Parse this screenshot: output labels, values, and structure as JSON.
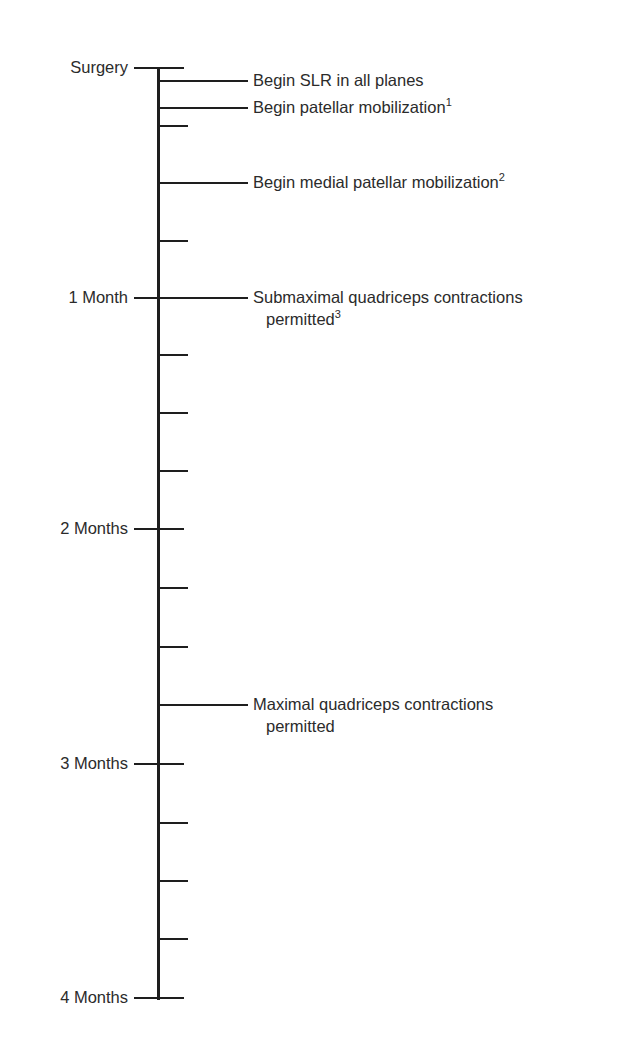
{
  "diagram": {
    "type": "vertical-timeline",
    "axis": {
      "x": 158,
      "y_start": 68,
      "y_end": 998
    },
    "month_labels": [
      {
        "text": "Surgery",
        "y": 68
      },
      {
        "text": "1 Month",
        "y": 298
      },
      {
        "text": "2 Months",
        "y": 529
      },
      {
        "text": "3 Months",
        "y": 764
      },
      {
        "text": "4 Months",
        "y": 998
      }
    ],
    "week_ticks": [
      126,
      183,
      241,
      355,
      413,
      471,
      588,
      647,
      705,
      823,
      881,
      939
    ],
    "events": [
      {
        "line1": "Begin SLR in all planes",
        "sup": "",
        "line2": "",
        "line2_sup": "",
        "y": 81
      },
      {
        "line1": "Begin patellar mobilization",
        "sup": "1",
        "line2": "",
        "line2_sup": "",
        "y": 108
      },
      {
        "line1": "Begin medial patellar mobilization",
        "sup": "2",
        "line2": "",
        "line2_sup": "",
        "y": 183
      },
      {
        "line1": "Submaximal quadriceps contractions",
        "sup": "",
        "line2": "permitted",
        "line2_sup": "3",
        "y": 298
      },
      {
        "line1": "Maximal quadriceps contractions",
        "sup": "",
        "line2": "permitted",
        "line2_sup": "",
        "y": 705
      }
    ]
  }
}
